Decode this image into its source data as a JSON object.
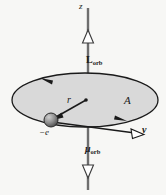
{
  "figure": {
    "background_color": "#f7f7f5",
    "orbit_fill_color": "#d9d9d9",
    "stroke_color": "#1a1a1a",
    "axis_color": "#555555"
  },
  "labels": {
    "z_axis": "z",
    "angular_momentum": "L",
    "angular_momentum_sub": "orb",
    "magnetic_moment": "μ",
    "magnetic_moment_sub": "orb",
    "radius": "r",
    "area": "A",
    "charge": "−e",
    "velocity": "v"
  },
  "geometry": {
    "axis_x": 88,
    "axis_top_y": 8,
    "axis_bottom_y": 190,
    "ellipse_center_x": 85,
    "ellipse_center_y": 100,
    "ellipse_rx": 73,
    "ellipse_ry": 27,
    "electron_x": 51,
    "electron_y": 120,
    "electron_radius": 7,
    "velocity_tip_x": 139,
    "velocity_tip_y": 133
  }
}
